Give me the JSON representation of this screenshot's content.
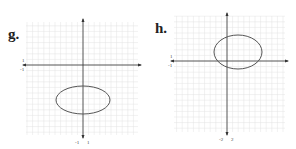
{
  "panels": [
    {
      "label": "g.",
      "grid": {
        "x0": 26,
        "y0": 22,
        "x1": 138,
        "y1": 135,
        "step": 5.6
      },
      "origin": {
        "x": 83,
        "y": 65
      },
      "ellipse": {
        "cx": 83,
        "cy": 100,
        "rx": 27,
        "ry": 14
      },
      "ticks": {
        "y_pos": "1",
        "y_neg": "-1",
        "x_neg": "-1",
        "x_pos": "1"
      }
    },
    {
      "label": "h.",
      "grid": {
        "x0": 174,
        "y0": 16,
        "x1": 285,
        "y1": 132,
        "step": 5.6
      },
      "origin": {
        "x": 227,
        "y": 61
      },
      "ellipse": {
        "cx": 238,
        "cy": 52,
        "rx": 24,
        "ry": 17
      },
      "ticks": {
        "y_pos": "1",
        "y_neg": "-1",
        "x_neg": "-2",
        "x_pos": "2"
      }
    }
  ],
  "colors": {
    "grid": "#e2e2e2",
    "axis": "#333333",
    "ellipse": "#555555"
  }
}
